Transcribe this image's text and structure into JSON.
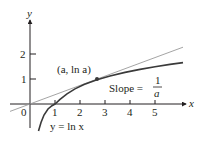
{
  "diagram": {
    "axes": {
      "x_label": "x",
      "y_label": "y",
      "origin_label": "0",
      "x_ticks": [
        "1",
        "2",
        "3",
        "4",
        "5"
      ],
      "y_ticks": [
        "1",
        "2"
      ]
    },
    "curve": {
      "label": "y = ln x",
      "color": "#3a3a3a"
    },
    "tangent": {
      "label_prefix": "Slope =",
      "fraction_num": "1",
      "fraction_den": "a",
      "color": "#9a9a9a"
    },
    "point": {
      "label": "(a, ln a)"
    }
  }
}
